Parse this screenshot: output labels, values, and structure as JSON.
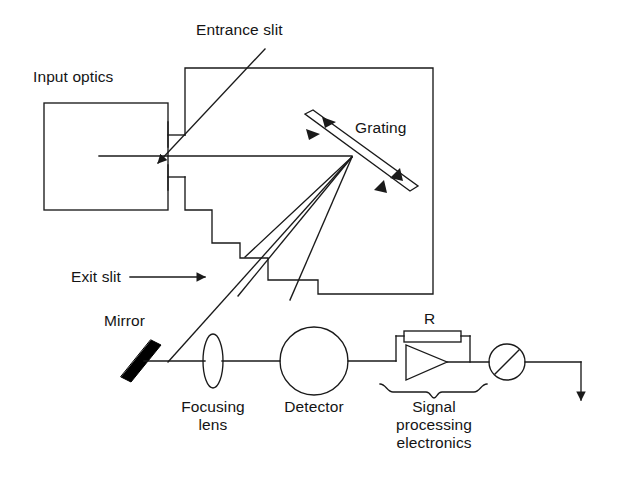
{
  "figure": {
    "type": "schematic-diagram",
    "background_color": "#ffffff",
    "line_color": "#1a1a1a",
    "mirror_color": "#000000"
  },
  "labels": {
    "input_optics": "Input optics",
    "entrance_slit": "Entrance slit",
    "grating": "Grating",
    "exit_slit": "Exit slit",
    "mirror": "Mirror",
    "focusing_lens_line1": "Focusing",
    "focusing_lens_line2": "lens",
    "detector": "Detector",
    "resistor": "R",
    "signal_line1": "Signal",
    "signal_line2": "processing",
    "signal_line3": "electronics"
  },
  "components": [
    {
      "name": "input-optics-box",
      "label": "Input optics",
      "shape": "rectangle"
    },
    {
      "name": "monochromator-housing",
      "label": "",
      "shape": "polygon"
    },
    {
      "name": "entrance-slit",
      "label": "Entrance slit",
      "shape": "gap"
    },
    {
      "name": "diffraction-grating",
      "label": "Grating",
      "shape": "tilted-bar",
      "rotatable": true
    },
    {
      "name": "exit-slit",
      "label": "Exit slit",
      "shape": "gap"
    },
    {
      "name": "mirror",
      "label": "Mirror",
      "shape": "thick-bar"
    },
    {
      "name": "focusing-lens",
      "label": "Focusing lens",
      "shape": "ellipse"
    },
    {
      "name": "detector",
      "label": "Detector",
      "shape": "circle"
    },
    {
      "name": "feedback-resistor",
      "label": "R",
      "shape": "rectangle"
    },
    {
      "name": "operational-amplifier",
      "label": "",
      "shape": "triangle"
    },
    {
      "name": "meter",
      "label": "",
      "shape": "circle-with-slash"
    },
    {
      "name": "signal-processing-electronics",
      "label": "Signal processing electronics",
      "shape": "brace"
    },
    {
      "name": "output-line",
      "label": "",
      "shape": "arrow"
    }
  ],
  "beams": {
    "incident_beam": "horizontal ray from input optics through entrance slit to grating",
    "diffracted_beams_count": 3,
    "selected_order_beam": "ray passing through exit slit to mirror",
    "reflected_beam": "horizontal ray from mirror through focusing lens to detector"
  }
}
